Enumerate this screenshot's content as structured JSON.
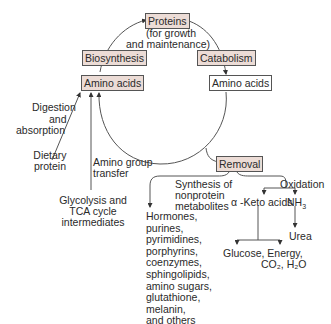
{
  "diagram": {
    "nodes": {
      "proteins": {
        "label": "Proteins",
        "note_line1": "(for growth",
        "note_line2": "and maintenance)"
      },
      "biosynthesis": {
        "label": "Biosynthesis"
      },
      "catabolism": {
        "label": "Catabolism"
      },
      "amino_acids_left": {
        "label": "Amino acids"
      },
      "amino_acids_right": {
        "label": "Amino acids"
      },
      "removal": {
        "label": "Removal"
      }
    },
    "sources": {
      "digestion_line1": "Digestion",
      "digestion_line2": "and",
      "digestion_line3": "absorption",
      "dietary_line1": "Dietary",
      "dietary_line2": "protein",
      "amino_group_line1": "Amino group",
      "amino_group_line2": "transfer",
      "glycolysis_line1": "Glycolysis and",
      "glycolysis_line2": "TCA cycle",
      "glycolysis_line3": "intermediates"
    },
    "removal_branches": {
      "synthesis_line1": "Synthesis of",
      "synthesis_line2": "nonprotein",
      "synthesis_line3": "metabolites",
      "oxidation": "Oxidation",
      "keto_acids": "α -Keto acids",
      "nh3": "NH",
      "nh3_sub": "3",
      "urea": "Urea",
      "glucose_energy": "Glucose, Energy,",
      "co2_h2o": "CO₂, H₂O"
    },
    "metabolites": [
      "Hormones,",
      "purines,",
      "pyrimidines,",
      "porphyrins,",
      "coenzymes,",
      "sphingolipids,",
      "amino sugars,",
      "glutathione,",
      "melanin,",
      "and others"
    ],
    "colors": {
      "shaded_box": "#ecdcd6",
      "line": "#444444"
    }
  }
}
